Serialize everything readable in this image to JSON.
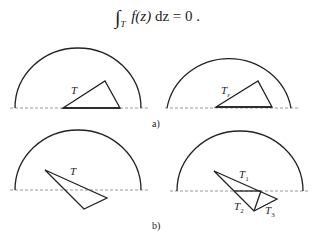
{
  "formula": {
    "integral_symbol": "∫",
    "subscript": "T",
    "function": "f(z)",
    "differential": "dz",
    "equals": "= 0",
    "end": " ."
  },
  "panels": {
    "a": {
      "caption": "a)",
      "left": {
        "triangle_label": "T"
      },
      "right": {
        "triangle_label": "T",
        "triangle_label_sub": "ε"
      }
    },
    "b": {
      "caption": "b)",
      "left": {
        "triangle_label": "T"
      },
      "right": {
        "labels": [
          {
            "main": "T",
            "sub": "1"
          },
          {
            "main": "T",
            "sub": "2"
          },
          {
            "main": "T",
            "sub": "3"
          }
        ]
      }
    }
  },
  "colors": {
    "stroke": "#222222",
    "dashed_axis": "#999999",
    "background": "#ffffff"
  }
}
